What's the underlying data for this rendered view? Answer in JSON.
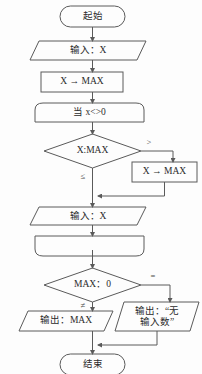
{
  "diagram": {
    "type": "flowchart",
    "orientation": "vertical",
    "colors": {
      "background": "#fdfdfd",
      "stroke": "#5a5a5a",
      "text": "#2b2b2b",
      "label": "#4a4a4a"
    },
    "nodes": [
      {
        "id": "start",
        "shape": "terminator",
        "label": "起始"
      },
      {
        "id": "input1",
        "shape": "parallelogram",
        "label": "输入：X"
      },
      {
        "id": "assign1",
        "shape": "rectangle",
        "label": "X → MAX"
      },
      {
        "id": "loop_start",
        "shape": "loop-head",
        "label": "当 x<>0"
      },
      {
        "id": "cmp1",
        "shape": "diamond",
        "label": "X:MAX"
      },
      {
        "id": "assign2",
        "shape": "rectangle",
        "label": "X → MAX"
      },
      {
        "id": "input2",
        "shape": "parallelogram",
        "label": "输入：X"
      },
      {
        "id": "loop_end",
        "shape": "loop-tail",
        "label": ""
      },
      {
        "id": "cmp2",
        "shape": "diamond",
        "label": "MAX：0"
      },
      {
        "id": "output1",
        "shape": "parallelogram",
        "label": "输出：MAX"
      },
      {
        "id": "output2",
        "shape": "parallelogram",
        "label": "输出：“无\n输入数”"
      },
      {
        "id": "end",
        "shape": "terminator",
        "label": "结束"
      }
    ],
    "edge_labels": {
      "cmp1_right": ">",
      "cmp1_down": "≤",
      "cmp2_right": "=",
      "cmp2_down": "≠"
    }
  }
}
